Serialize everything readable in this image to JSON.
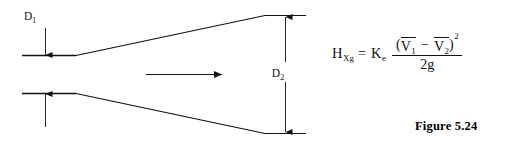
{
  "figure": {
    "caption": "Figure 5.24",
    "background_color": "#ffffff",
    "line_color": "#111111"
  },
  "diagram": {
    "inlet_label": "D",
    "inlet_label_subscript": "1",
    "outlet_label": "D",
    "outlet_label_subscript": "2",
    "flow_arrow_name": "flow-direction-arrow"
  },
  "equation": {
    "lhs_symbol": "H",
    "lhs_subscript": "Xg",
    "equals": "=",
    "coefficient_symbol": "K",
    "coefficient_subscript": "e",
    "numerator_open_paren": "(",
    "numerator_var1": "V",
    "numerator_var1_subscript": "1",
    "numerator_operator": "−",
    "numerator_var2": "V",
    "numerator_var2_subscript": "2",
    "numerator_close_paren": ")",
    "numerator_exponent": "2",
    "denominator": "2g",
    "plain_text": "H_Xg = K_e ( V̅1 − V̅2 )² / 2g"
  }
}
